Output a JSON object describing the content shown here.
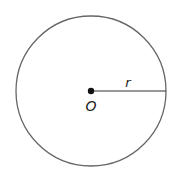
{
  "diagram": {
    "type": "circle",
    "center_label": "O",
    "radius_label": "r",
    "colors": {
      "stroke": "#555555",
      "text": "#1a1a1a",
      "background": "#ffffff"
    }
  }
}
